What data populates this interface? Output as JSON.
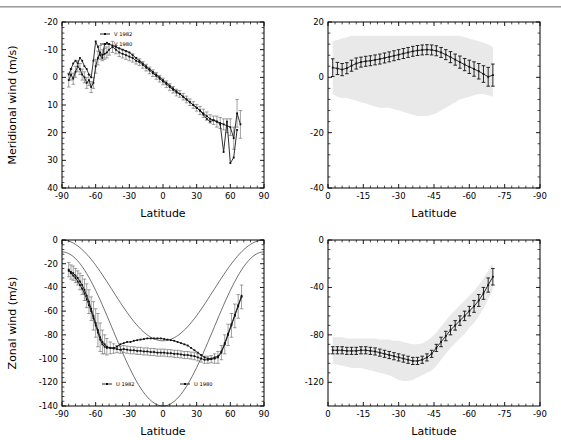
{
  "figure": {
    "x_axis_label": "Latitude",
    "panels": [
      "top-left",
      "top-right",
      "bottom-left",
      "bottom-right"
    ]
  },
  "chart_data": [
    {
      "id": "meridional-observed",
      "type": "scatter",
      "title": "",
      "xlabel": "Latitude",
      "ylabel": "Meridional wind (m/s)",
      "xlim": [
        -90,
        90
      ],
      "ylim": [
        -20,
        40
      ],
      "xticks": [
        -90,
        -60,
        -30,
        0,
        30,
        60,
        90
      ],
      "yticks": [
        -20,
        -10,
        0,
        10,
        20,
        30,
        40
      ],
      "grid": false,
      "legend_position": "top-left",
      "legend": [
        "V 1982",
        "V 1980"
      ],
      "series": [
        {
          "name": "V 1982",
          "x": [
            -84,
            -82,
            -80,
            -78,
            -76,
            -74,
            -72,
            -70,
            -68,
            -66,
            -64,
            -62,
            -60,
            -58,
            -56,
            -54,
            -52,
            -50,
            -48,
            -45,
            -42,
            -39,
            -36,
            -33,
            -30,
            -27,
            -24,
            -21,
            -18,
            -15,
            -12,
            -9,
            -6,
            -3,
            0,
            3,
            6,
            9,
            12,
            15,
            18,
            21,
            24,
            27,
            30,
            33,
            36,
            39,
            42,
            45,
            48,
            51,
            54,
            57,
            60,
            63,
            66,
            69
          ],
          "y": [
            1,
            -1,
            0.5,
            -2,
            -4,
            -3,
            -1,
            0,
            2,
            1,
            3.5,
            2,
            -4,
            -7,
            -9,
            -8,
            -8.5,
            -9,
            -10,
            -11,
            -10,
            -9,
            -8.5,
            -8,
            -7.5,
            -7,
            -6,
            -5.5,
            -4.5,
            -3.5,
            -2.5,
            -1.5,
            -0.5,
            0.5,
            1.5,
            2.5,
            3.5,
            4.5,
            5.5,
            6,
            7,
            8,
            9,
            10,
            11,
            12,
            13,
            14,
            15,
            15.5,
            16,
            16.5,
            17,
            17.5,
            18,
            22,
            13,
            17
          ],
          "yerr": [
            2.5,
            2,
            2,
            2,
            2,
            2,
            2,
            2,
            2,
            2,
            2,
            2,
            2.5,
            2.5,
            2.5,
            2,
            2,
            2,
            2,
            2,
            1.5,
            1.5,
            1.5,
            1.5,
            1.5,
            1.5,
            1.2,
            1.2,
            1.2,
            1.2,
            1.2,
            1.2,
            1.2,
            1.2,
            1.2,
            1.2,
            1.2,
            1.2,
            1.2,
            1.2,
            1.2,
            1.2,
            1.2,
            1.2,
            1.2,
            1.5,
            1.5,
            1.5,
            1.5,
            1.5,
            2,
            2,
            2,
            2.5,
            3,
            4,
            5,
            5
          ]
        },
        {
          "name": "V 1980",
          "x": [
            -84,
            -82,
            -80,
            -78,
            -76,
            -74,
            -72,
            -70,
            -68,
            -66,
            -64,
            -62,
            -60,
            -58,
            -56,
            -54,
            -52,
            -50,
            -48,
            -45,
            -42,
            -39,
            -36,
            -33,
            -30,
            -27,
            -24,
            -21,
            -18,
            -15,
            -12,
            -9,
            -6,
            -3,
            0,
            3,
            6,
            9,
            12,
            15,
            18,
            21,
            24,
            27,
            30,
            33,
            36,
            39,
            42,
            45,
            48,
            51,
            54,
            57,
            60,
            63,
            66
          ],
          "y": [
            -1,
            -3,
            -5,
            -6,
            -5,
            -7,
            -6,
            -4,
            -3,
            -1,
            0,
            -6,
            -13,
            -11,
            -8,
            -7,
            -12,
            -12.5,
            -12,
            -11.5,
            -11,
            -10.5,
            -10,
            -9.5,
            -9,
            -8,
            -7,
            -6,
            -5,
            -4,
            -3,
            -2,
            -1,
            0,
            1,
            2,
            3,
            4,
            5,
            6,
            7,
            8,
            9,
            10,
            11,
            12,
            13.5,
            15,
            16,
            15.5,
            16,
            17,
            27,
            16,
            31,
            29,
            19
          ]
        }
      ]
    },
    {
      "id": "meridional-model",
      "type": "line",
      "title": "",
      "xlabel": "Latitude",
      "ylabel": "",
      "xlim": [
        0,
        -90
      ],
      "ylim": [
        20,
        -40
      ],
      "xticks": [
        0,
        -15,
        -30,
        -45,
        -60,
        -75,
        -90
      ],
      "yticks": [
        -40,
        -20,
        0,
        20
      ],
      "grid": false,
      "shaded_band": true,
      "series": [
        {
          "name": "mean",
          "x": [
            -2,
            -4,
            -6,
            -8,
            -10,
            -12,
            -14,
            -16,
            -18,
            -20,
            -22,
            -24,
            -26,
            -28,
            -30,
            -32,
            -34,
            -36,
            -38,
            -40,
            -42,
            -44,
            -46,
            -48,
            -50,
            -52,
            -54,
            -56,
            -58,
            -60,
            -62,
            -64,
            -66,
            -68,
            -70
          ],
          "y": [
            3.5,
            3.2,
            2.8,
            3.3,
            4.2,
            5.0,
            5.5,
            5.8,
            6.0,
            6.3,
            6.6,
            7.0,
            7.4,
            7.8,
            8.2,
            8.6,
            9.0,
            9.4,
            9.7,
            9.9,
            10.0,
            9.9,
            9.6,
            9.0,
            8.2,
            7.3,
            6.4,
            5.5,
            4.6,
            3.8,
            3.0,
            2.2,
            1.2,
            0.2,
            0.8
          ],
          "yerr": [
            3.2,
            2.2,
            2.2,
            2.0,
            2.0,
            2.0,
            1.8,
            1.8,
            1.8,
            1.8,
            1.8,
            1.8,
            1.8,
            1.8,
            1.8,
            1.8,
            1.8,
            1.8,
            1.8,
            1.8,
            1.8,
            1.8,
            1.8,
            1.8,
            1.8,
            2.0,
            2.0,
            2.2,
            2.2,
            2.4,
            2.6,
            2.8,
            3.0,
            3.4,
            4.0
          ],
          "band_upper": [
            -6,
            -7,
            -7.5,
            -7.5,
            -8,
            -8.5,
            -9,
            -9.5,
            -10,
            -10.5,
            -11,
            -11,
            -11,
            -11.5,
            -12,
            -12.5,
            -13,
            -13.5,
            -14,
            -14,
            -14,
            -13.5,
            -13,
            -12,
            -11,
            -10,
            -9,
            -8,
            -7.5,
            -7,
            -6.5,
            -6,
            -6,
            -6.5,
            -7
          ],
          "band_lower": [
            13,
            13.5,
            14,
            14.5,
            15,
            15,
            15,
            15,
            15,
            15,
            15,
            15,
            15,
            15,
            15,
            15,
            15,
            15,
            15,
            15,
            15,
            15,
            15,
            15,
            15,
            15,
            15,
            15,
            14.5,
            14,
            13.5,
            13,
            12.5,
            12,
            11
          ]
        }
      ]
    },
    {
      "id": "zonal-observed",
      "type": "scatter",
      "title": "",
      "xlabel": "Latitude",
      "ylabel": "Zonal wind (m/s)",
      "xlim": [
        -90,
        90
      ],
      "ylim": [
        0,
        -140
      ],
      "xticks": [
        -90,
        -60,
        -30,
        0,
        30,
        60,
        90
      ],
      "yticks": [
        0,
        -20,
        -40,
        -60,
        -80,
        -100,
        -120,
        -140
      ],
      "grid": false,
      "legend_position": "bottom-center",
      "legend": [
        "U 1982",
        "U 1980"
      ],
      "series": [
        {
          "name": "U 1982",
          "x": [
            -84,
            -82,
            -80,
            -78,
            -76,
            -74,
            -72,
            -70,
            -68,
            -66,
            -64,
            -62,
            -60,
            -58,
            -56,
            -54,
            -52,
            -50,
            -47,
            -44,
            -41,
            -38,
            -35,
            -32,
            -29,
            -26,
            -23,
            -20,
            -17,
            -14,
            -11,
            -8,
            -5,
            -2,
            1,
            4,
            7,
            10,
            13,
            16,
            19,
            22,
            25,
            28,
            31,
            34,
            37,
            40,
            43,
            46,
            49,
            52,
            55,
            58,
            61,
            64,
            67,
            70
          ],
          "y": [
            -25,
            -27,
            -28,
            -30,
            -32,
            -35,
            -38,
            -42,
            -47,
            -52,
            -58,
            -64,
            -70,
            -76,
            -82,
            -86,
            -88,
            -90,
            -91,
            -91.5,
            -92,
            -92.5,
            -92,
            -92.5,
            -93,
            -93,
            -93.5,
            -93.5,
            -94,
            -94,
            -94.5,
            -94.5,
            -95,
            -95,
            -95,
            -95.5,
            -95.5,
            -96,
            -96,
            -96.5,
            -97,
            -97,
            -97.5,
            -98,
            -99,
            -100,
            -101,
            -101,
            -100.5,
            -100,
            -99,
            -95,
            -88,
            -80,
            -72,
            -64,
            -56,
            -48
          ],
          "yerr": [
            6,
            6,
            6,
            6,
            6,
            7,
            8,
            9,
            10,
            10,
            10,
            12,
            12,
            14,
            12,
            10,
            8,
            7,
            5,
            4,
            3,
            3,
            3,
            3,
            3,
            3,
            3,
            3,
            3,
            3,
            3,
            3,
            3,
            3,
            3,
            3,
            3,
            3,
            3,
            3,
            3,
            3,
            3,
            3,
            3,
            3,
            3,
            3,
            3,
            4,
            5,
            6,
            8,
            9,
            10,
            10,
            10,
            10
          ]
        },
        {
          "name": "U 1980",
          "x": [
            -84,
            -82,
            -80,
            -78,
            -76,
            -74,
            -72,
            -70,
            -68,
            -66,
            -64,
            -62,
            -60,
            -58,
            -56,
            -54,
            -52,
            -50,
            -47,
            -44,
            -41,
            -38,
            -35,
            -32,
            -29,
            -26,
            -23,
            -20,
            -17,
            -14,
            -11,
            -8,
            -5,
            -2,
            1,
            4,
            7,
            10,
            13,
            16,
            19,
            22,
            25,
            28,
            31,
            34,
            37,
            40,
            43,
            46,
            49,
            52,
            55,
            58,
            61,
            64,
            67,
            70
          ],
          "y": [
            -26,
            -28,
            -30,
            -32,
            -35,
            -38,
            -41,
            -45,
            -50,
            -55,
            -60,
            -66,
            -72,
            -78,
            -84,
            -88,
            -90,
            -91,
            -91,
            -91,
            -90,
            -88,
            -87,
            -86,
            -86,
            -85,
            -84.5,
            -84,
            -83.5,
            -83,
            -83,
            -83,
            -83,
            -83,
            -83.5,
            -84,
            -84.5,
            -85,
            -86,
            -87,
            -88,
            -89,
            -91,
            -93,
            -95,
            -97,
            -99,
            -100,
            -100,
            -99,
            -98,
            -94,
            -87,
            -79,
            -71,
            -63,
            -55,
            -47
          ]
        }
      ],
      "reference_curves": [
        {
          "name": "upper-cos2",
          "peak": -140,
          "edge": -10
        },
        {
          "name": "lower-cos2",
          "peak": -85,
          "edge": 0
        }
      ]
    },
    {
      "id": "zonal-model",
      "type": "line",
      "title": "",
      "xlabel": "Latitude",
      "ylabel": "",
      "xlim": [
        0,
        -90
      ],
      "ylim": [
        0,
        -140
      ],
      "xticks": [
        0,
        -15,
        -30,
        -45,
        -60,
        -75,
        -90
      ],
      "yticks": [
        -120,
        -80,
        -40,
        0
      ],
      "grid": false,
      "shaded_band": true,
      "series": [
        {
          "name": "mean",
          "x": [
            -2,
            -4,
            -6,
            -8,
            -10,
            -12,
            -14,
            -16,
            -18,
            -20,
            -22,
            -24,
            -26,
            -28,
            -30,
            -32,
            -34,
            -36,
            -38,
            -40,
            -42,
            -44,
            -46,
            -48,
            -50,
            -52,
            -54,
            -56,
            -58,
            -60,
            -62,
            -64,
            -66,
            -68,
            -70
          ],
          "y": [
            -93,
            -93,
            -93,
            -93.5,
            -93.5,
            -93.5,
            -93,
            -93,
            -93.5,
            -94,
            -95,
            -96,
            -97,
            -98,
            -99,
            -100,
            -101,
            -102,
            -102,
            -101,
            -99,
            -96,
            -91,
            -86,
            -81,
            -76,
            -72,
            -68,
            -64,
            -60,
            -56,
            -51,
            -45,
            -38,
            -31
          ],
          "yerr": [
            3,
            3,
            3,
            3,
            3,
            3,
            3,
            3,
            3,
            3,
            3,
            3,
            3,
            3,
            3,
            3,
            3,
            3,
            3,
            3,
            3,
            3,
            3,
            4,
            4,
            4,
            4,
            4,
            4,
            4,
            5,
            5,
            5,
            6,
            7
          ],
          "band_upper": [
            -104,
            -105,
            -106,
            -107,
            -108,
            -108,
            -108,
            -109,
            -110,
            -111,
            -112,
            -113,
            -114,
            -116,
            -118,
            -119,
            -119,
            -118,
            -116,
            -114,
            -112,
            -110,
            -106,
            -101,
            -96,
            -91,
            -87,
            -83,
            -79,
            -74,
            -70,
            -64,
            -58,
            -50,
            -42
          ],
          "band_lower": [
            -82,
            -82,
            -82,
            -83,
            -83,
            -83,
            -83,
            -83,
            -83,
            -83,
            -84,
            -84,
            -84,
            -85,
            -85,
            -86,
            -87,
            -88,
            -88,
            -87,
            -85,
            -82,
            -78,
            -73,
            -68,
            -63,
            -59,
            -55,
            -51,
            -47,
            -43,
            -38,
            -32,
            -26,
            -20
          ]
        }
      ]
    }
  ]
}
